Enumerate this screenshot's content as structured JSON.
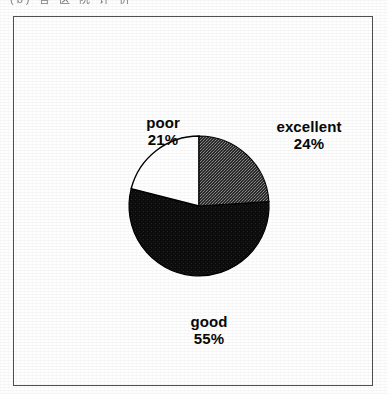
{
  "page": {
    "caption_clipped": "(b)  各 医 院 评 价",
    "background_color": "#fefefe",
    "frame_color": "#4d4d4d"
  },
  "chart_data": {
    "type": "pie",
    "title": "",
    "subtitle": "",
    "xlabel": "",
    "ylabel": "",
    "legend_position": "none",
    "grid": false,
    "labels_on_slices": true,
    "start_angle_deg": 0,
    "direction": "clockwise",
    "categories": [
      "excellent",
      "good",
      "poor"
    ],
    "values": [
      24,
      55,
      21
    ],
    "units": "%",
    "slices": [
      {
        "label": "excellent",
        "value": 24,
        "percent_text": "24%",
        "fill": "#3a3a3a",
        "pattern": "dither-gray",
        "stroke": "#000000"
      },
      {
        "label": "good",
        "value": 55,
        "percent_text": "55%",
        "fill": "#0d0d0d",
        "pattern": "solid-black",
        "stroke": "#000000"
      },
      {
        "label": "poor",
        "value": 21,
        "percent_text": "21%",
        "fill": "#ffffff",
        "pattern": "solid-white",
        "stroke": "#000000"
      }
    ],
    "geometry": {
      "center_x": 198,
      "center_y": 205,
      "radius": 70
    }
  }
}
